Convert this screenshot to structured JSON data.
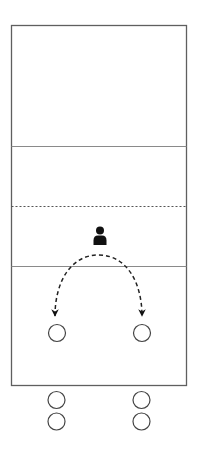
{
  "diagram": {
    "type": "volleyball-drill",
    "court": {
      "x": 11.5,
      "y": 25.5,
      "width": 175,
      "height": 360,
      "stroke": "#5f5f5f",
      "lines": [
        {
          "name": "back-zone-line",
          "y": 146.5,
          "style": "solid",
          "stroke": "#8a8a8a"
        },
        {
          "name": "net-line",
          "y": 206.5,
          "style": "dotted",
          "stroke": "#555555"
        },
        {
          "name": "attack-line",
          "y": 266.5,
          "style": "solid",
          "stroke": "#8a8a8a"
        }
      ]
    },
    "coach": {
      "x": 100,
      "y": 230,
      "color": "#111111"
    },
    "movement_arc": {
      "from": [
        55,
        317
      ],
      "peak": [
        98.5,
        255
      ],
      "to": [
        142,
        317
      ],
      "style": "dashed",
      "color": "#222222",
      "arrowheads": "both-ends-down"
    },
    "players_on_court": [
      {
        "x": 57,
        "y": 333,
        "r": 8.5
      },
      {
        "x": 142,
        "y": 333,
        "r": 8.5
      }
    ],
    "players_waiting": [
      {
        "x": 56.5,
        "y": 400,
        "r": 8.5
      },
      {
        "x": 56.5,
        "y": 421.5,
        "r": 8.5
      },
      {
        "x": 141.5,
        "y": 400,
        "r": 8.5
      },
      {
        "x": 141.5,
        "y": 421.5,
        "r": 8.5
      }
    ],
    "player_stroke": "#444444"
  }
}
